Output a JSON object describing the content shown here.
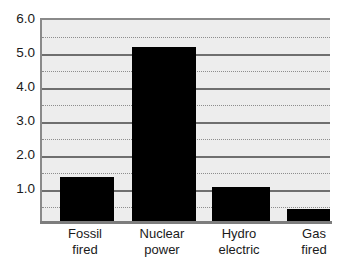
{
  "chart_data": {
    "type": "bar",
    "title": "",
    "subtitle": "",
    "xlabel": "",
    "ylabel": "",
    "categories": [
      "Fossil fired",
      "Nuclear power",
      "Hydro electric",
      "Gas fired"
    ],
    "category_lines": [
      [
        "Fossil",
        "fired"
      ],
      [
        "Nuclear",
        "power"
      ],
      [
        "Hydro",
        "electric"
      ],
      [
        "Gas",
        "fired"
      ]
    ],
    "values": [
      1.35,
      5.2,
      1.05,
      0.4
    ],
    "ylim": [
      0,
      6.0
    ],
    "xlim": [
      0,
      4
    ],
    "y_major_ticks": [
      1.0,
      2.0,
      3.0,
      4.0,
      5.0,
      6.0
    ],
    "y_tick_labels": [
      "1.0",
      "2.0",
      "3.0",
      "4.0",
      "5.0",
      "6.0"
    ],
    "y_minor_ticks": [
      0.5,
      1.5,
      2.5,
      3.5,
      4.5,
      5.5
    ],
    "grid": true,
    "grid_major_style": "solid",
    "grid_minor_style": "dotted",
    "legend": false,
    "legend_position": "none",
    "bar_color": "#000000",
    "plot_background": "#ededed",
    "figure_background": "#ffffff",
    "axis_color": "#7d7d7d",
    "grid_major_color": "#6f6f6f",
    "grid_minor_color": "#8d8d8d",
    "annotations": []
  }
}
